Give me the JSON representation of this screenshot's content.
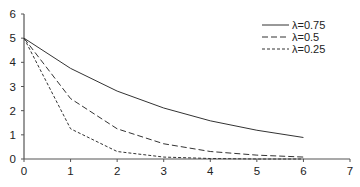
{
  "chart_data": {
    "type": "line",
    "title": "",
    "xlabel": "",
    "ylabel": "",
    "xlim": [
      0,
      7
    ],
    "ylim": [
      0,
      6
    ],
    "x_ticks": [
      0,
      1,
      2,
      3,
      4,
      5,
      6,
      7
    ],
    "y_ticks": [
      0,
      1,
      2,
      3,
      4,
      5,
      6
    ],
    "grid": false,
    "legend_position": "upper right",
    "x": [
      0,
      1,
      2,
      3,
      4,
      5,
      6
    ],
    "series": [
      {
        "name": "λ=0.75",
        "style": "solid",
        "values": [
          5,
          3.75,
          2.81,
          2.11,
          1.58,
          1.19,
          0.89
        ]
      },
      {
        "name": "λ=0.5",
        "style": "dashed",
        "values": [
          5,
          2.5,
          1.25,
          0.63,
          0.31,
          0.16,
          0.08
        ]
      },
      {
        "name": "λ=0.25",
        "style": "dotted",
        "values": [
          5,
          1.25,
          0.31,
          0.08,
          0.02,
          0.0,
          0.0
        ]
      }
    ]
  },
  "colors": {
    "line": "#333333",
    "axis": "#555555"
  }
}
